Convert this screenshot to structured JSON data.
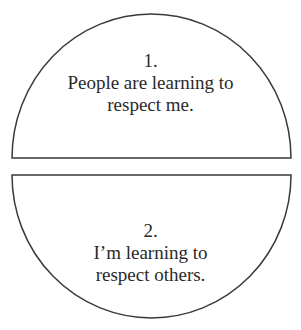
{
  "diagram": {
    "stroke_color": "#3a3a3a",
    "fill_color": "#ffffff",
    "halves": [
      {
        "position": "top",
        "number": "1.",
        "line1": "People are learning to",
        "line2": "respect me."
      },
      {
        "position": "bottom",
        "number": "2.",
        "line1": "I’m learning to",
        "line2": "respect others."
      }
    ]
  }
}
